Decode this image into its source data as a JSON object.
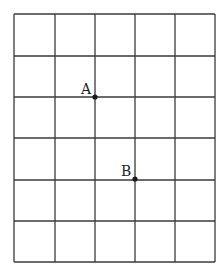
{
  "grid": {
    "columns": 5,
    "rows": 6,
    "x_lines": [
      14,
      55,
      95,
      135,
      175,
      215
    ],
    "y_lines": [
      14,
      56,
      97,
      138,
      180,
      221,
      262
    ],
    "line_color": "#3a3a3a"
  },
  "points": [
    {
      "label": "A",
      "x": 95,
      "y": 97,
      "label_x": 81,
      "label_y": 94
    },
    {
      "label": "B",
      "x": 135,
      "y": 179,
      "label_x": 121,
      "label_y": 176
    }
  ]
}
